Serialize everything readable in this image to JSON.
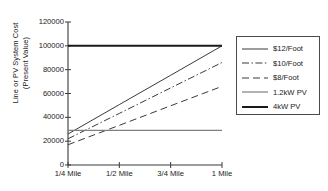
{
  "chart_data": {
    "type": "line",
    "title": "",
    "xlabel": "",
    "ylabel": "Line or PV System Cost (Present Value)",
    "ylabel_line1": "Line or PV System Cost",
    "ylabel_line2": "(Present Value)",
    "categories": [
      "1/4 Mile",
      "1/2 Mile",
      "3/4 Mile",
      "1 Mile"
    ],
    "x": [
      0.25,
      0.5,
      0.75,
      1.0
    ],
    "xlim": [
      0.25,
      1.0
    ],
    "ylim": [
      0,
      120000
    ],
    "y_ticks": [
      0,
      20000,
      40000,
      60000,
      80000,
      100000,
      120000
    ],
    "y_tick_labels": [
      "0",
      "20000",
      "40000",
      "60000",
      "80000",
      "100000",
      "120000"
    ],
    "grid": false,
    "legend_position": "right",
    "series": [
      {
        "name": "$12/Foot",
        "style": "solid-thin",
        "color": "#3a3a3a",
        "width": 1.0,
        "values": [
          26000,
          50700,
          75300,
          100000
        ]
      },
      {
        "name": "$10/Foot",
        "style": "dash-dot",
        "color": "#3a3a3a",
        "width": 1.0,
        "values": [
          22000,
          43300,
          64700,
          86000
        ]
      },
      {
        "name": "$8/Foot",
        "style": "dashed",
        "color": "#3a3a3a",
        "width": 1.0,
        "values": [
          17000,
          33300,
          49700,
          66000
        ]
      },
      {
        "name": "1.2kW PV",
        "style": "solid-gray",
        "color": "#808080",
        "width": 1.2,
        "values": [
          29000,
          29000,
          29000,
          29000
        ]
      },
      {
        "name": "4kW PV",
        "style": "solid-thick",
        "color": "#1a1a1a",
        "width": 2.0,
        "values": [
          100000,
          100000,
          100000,
          100000
        ]
      }
    ]
  },
  "legend": {
    "items": [
      {
        "label": "$12/Foot"
      },
      {
        "label": "$10/Foot"
      },
      {
        "label": "$8/Foot"
      },
      {
        "label": "1.2kW PV"
      },
      {
        "label": "4kW PV"
      }
    ]
  },
  "axes": {
    "y_title_line1": "Line or PV System Cost",
    "y_title_line2": "(Present Value)"
  }
}
